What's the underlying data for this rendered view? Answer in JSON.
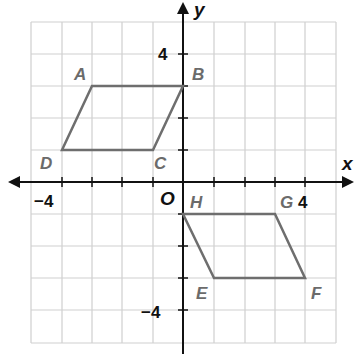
{
  "diagram": {
    "axes": {
      "x_label": "x",
      "y_label": "y",
      "origin_label": "O",
      "range": [
        -5,
        5
      ]
    },
    "tick_labels": {
      "x_neg": "−4",
      "x_pos": "4",
      "y_pos": "4",
      "y_neg": "−4"
    },
    "shapes": [
      {
        "name": "ABCD",
        "vertices": [
          {
            "label": "A",
            "x": -3,
            "y": 3
          },
          {
            "label": "B",
            "x": 0,
            "y": 3
          },
          {
            "label": "C",
            "x": -1,
            "y": 1
          },
          {
            "label": "D",
            "x": -4,
            "y": 1
          }
        ]
      },
      {
        "name": "HGFE",
        "vertices": [
          {
            "label": "H",
            "x": 0,
            "y": -1
          },
          {
            "label": "G",
            "x": 3,
            "y": -1
          },
          {
            "label": "F",
            "x": 4,
            "y": -3
          },
          {
            "label": "E",
            "x": 1,
            "y": -3
          }
        ]
      }
    ],
    "colors": {
      "grid": "#c8c8c8",
      "shape": "#6e6e6e",
      "axis": "#111111"
    }
  }
}
